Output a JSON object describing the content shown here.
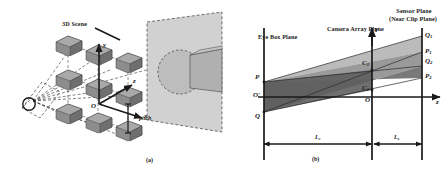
{
  "figure": {
    "panel_a": {
      "tag": "(a)",
      "labels": {
        "scene": "3D Scene",
        "axis_y": "y",
        "axis_x": "x",
        "axis_z": "z",
        "origin": "O",
        "pitch": "pitch"
      }
    },
    "panel_b": {
      "tag": "(b)",
      "planes": {
        "eye_box": "Eye Box Plane",
        "camera_array": "Camera Array Plane",
        "sensor_line1": "Sensor Plane",
        "sensor_line2": "(Near Clip Plane)"
      },
      "axes": {
        "vertical": "Y",
        "horizontal": "z",
        "origin_eye": "O'",
        "origin_cam": "O"
      },
      "points": {
        "eye_top": "P",
        "eye_bottom": "Q",
        "cam_top": "C",
        "cam_top_sub": "1",
        "cam_bottom": "C",
        "cam_bottom_sub": "2",
        "sensor_q1": "Q",
        "sensor_q1_sub": "1",
        "sensor_p1": "P",
        "sensor_p1_sub": "1",
        "sensor_q2": "Q",
        "sensor_q2_sub": "2",
        "sensor_p2": "P",
        "sensor_p2_sub": "2"
      },
      "dimensions": {
        "d1": "L",
        "d1_sub": "c",
        "d2": "L",
        "d2_sub": "s"
      }
    },
    "colors": {
      "ink": "#1a1a1a",
      "cube_fill": "#8a8a8a",
      "cube_top": "#a8a8a8",
      "cube_side": "#6e6e6e",
      "scene_panel": "#cfcfcf",
      "beam_dark": "#6f6f6f",
      "beam_mid": "#9a9a9a",
      "beam_light": "#b9b9b9",
      "dash": "#4a4a4a"
    }
  }
}
